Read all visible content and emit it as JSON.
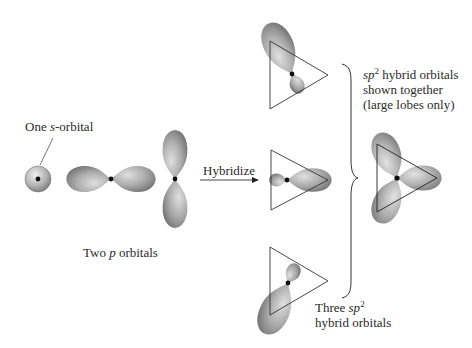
{
  "diagram": {
    "colors": {
      "lobe_fill": "#a8a8a8",
      "lobe_highlight": "#e2e2e2",
      "lobe_shadow": "#6a6a6a",
      "nucleus": "#111111",
      "line": "#333333",
      "text": "#2a2a2a"
    },
    "labels": {
      "s_orbital": {
        "prefix": "One ",
        "italic": "s",
        "suffix": "-orbital"
      },
      "p_orbitals": {
        "prefix": "Two ",
        "italic": "p",
        "suffix": " orbitals"
      },
      "arrow": "Hybridize",
      "together": {
        "line1_italic": "sp",
        "line1_sup": "2",
        "line1_suffix": " hybrid orbitals",
        "line2": "shown together",
        "line3": "(large lobes only)"
      },
      "three": {
        "line1_prefix": "Three ",
        "line1_italic": "sp",
        "line1_sup": "2",
        "line2": "hybrid orbitals"
      }
    },
    "nodes": [
      {
        "id": "s-orbital",
        "label": "One s-orbital"
      },
      {
        "id": "p-orbital-horizontal",
        "label": "p orbital (horizontal)"
      },
      {
        "id": "p-orbital-vertical",
        "label": "p orbital (vertical)"
      },
      {
        "id": "sp2-hybrid-top",
        "label": "sp2 hybrid orbital (upper-left lobe)"
      },
      {
        "id": "sp2-hybrid-middle",
        "label": "sp2 hybrid orbital (right lobe)"
      },
      {
        "id": "sp2-hybrid-bottom",
        "label": "sp2 hybrid orbital (lower-left lobe)"
      },
      {
        "id": "sp2-combined",
        "label": "sp2 hybrid orbitals shown together"
      }
    ],
    "edges": [
      {
        "from": "p-orbital-vertical",
        "to": "sp2-hybrid-middle",
        "label": "Hybridize"
      }
    ]
  }
}
